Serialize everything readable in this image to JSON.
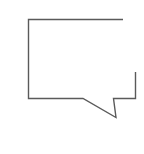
{
  "icon": {
    "name": "speech-bubble-icon",
    "stroke_color": "#5a5a5a",
    "background": "#ffffff"
  }
}
